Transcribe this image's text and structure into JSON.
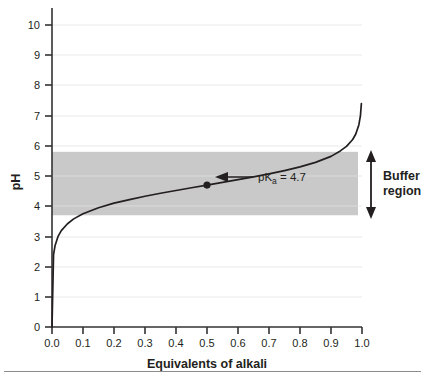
{
  "chart_data": {
    "type": "line",
    "title": "",
    "xlabel": "Equivalents of alkali",
    "ylabel": "pH",
    "xlim": [
      0.0,
      1.0
    ],
    "ylim": [
      0,
      10.5
    ],
    "grid": true,
    "legend": "none",
    "xticks": [
      "0.0",
      "0.1",
      "0.2",
      "0.3",
      "0.4",
      "0.5",
      "0.6",
      "0.7",
      "0.8",
      "0.9",
      "1.0"
    ],
    "xtick_values": [
      0.0,
      0.1,
      0.2,
      0.3,
      0.4,
      0.5,
      0.6,
      0.7,
      0.8,
      0.9,
      1.0
    ],
    "yticks": [
      "0",
      "1",
      "2",
      "3",
      "4",
      "5",
      "6",
      "7",
      "8",
      "9",
      "10"
    ],
    "ytick_values": [
      0,
      1,
      2,
      3,
      4,
      5,
      6,
      7,
      8,
      9,
      10
    ],
    "series": [
      {
        "name": "Titration curve",
        "color": "#231f20",
        "x": [
          0.0,
          0.005,
          0.01,
          0.02,
          0.03,
          0.05,
          0.07,
          0.1,
          0.15,
          0.2,
          0.25,
          0.3,
          0.35,
          0.4,
          0.45,
          0.5,
          0.55,
          0.6,
          0.65,
          0.7,
          0.75,
          0.8,
          0.85,
          0.9,
          0.93,
          0.95,
          0.97,
          0.98,
          0.99,
          0.995,
          0.998
        ],
        "y": [
          0.0,
          2.4,
          2.7,
          3.01,
          3.19,
          3.42,
          3.58,
          3.75,
          3.95,
          4.1,
          4.22,
          4.33,
          4.43,
          4.52,
          4.61,
          4.7,
          4.79,
          4.88,
          4.97,
          5.07,
          5.18,
          5.3,
          5.45,
          5.65,
          5.83,
          5.98,
          6.21,
          6.39,
          6.7,
          7.0,
          7.4
        ]
      }
    ],
    "shaded_band": {
      "label": "Buffer region",
      "ymin": 3.7,
      "ymax": 5.8,
      "color": "#c9c9c9"
    },
    "annotations": [
      {
        "name": "pka-point",
        "label_prefix": "pK",
        "label_sub": "a",
        "label_suffix": " = 4.7",
        "x": 0.5,
        "y": 4.7,
        "value": 4.7
      },
      {
        "name": "buffer-region-label",
        "line1": "Buffer",
        "line2": "region"
      }
    ]
  },
  "axes": {
    "y_title": "pH",
    "x_title": "Equivalents of alkali"
  },
  "colors": {
    "curve": "#231f20",
    "band": "#c9c9c9",
    "grid": "#f1f1f1",
    "axis": "#333333",
    "rule": "#8c8c8c"
  }
}
